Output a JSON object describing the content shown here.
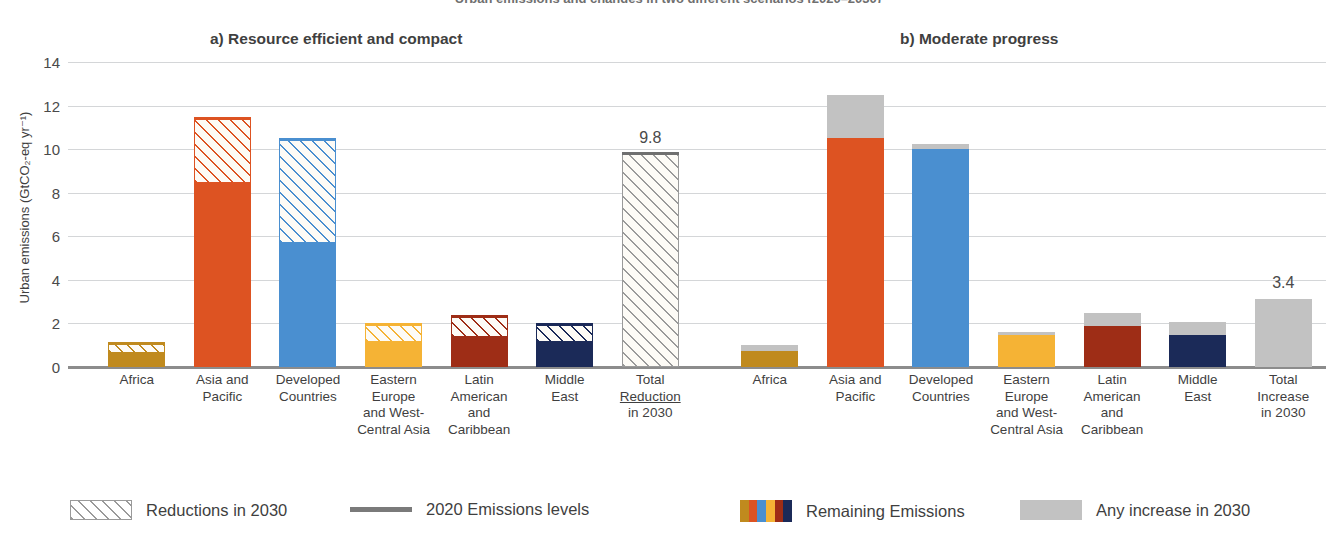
{
  "figure": {
    "suptitle": "Urban emissions and changes in two different scenarios (2020–2030)",
    "y_axis_label": "Urban emissions (GtCO₂-eq yr⁻¹)",
    "y_ticks": [
      "14",
      "12",
      "10",
      "8",
      "6",
      "4",
      "2",
      "0"
    ]
  },
  "panels": {
    "a": {
      "title": "a) Resource efficient and compact"
    },
    "b": {
      "title": "b) Moderate progress"
    }
  },
  "legend": {
    "items": [
      {
        "label": "Reductions in 2030",
        "swatch": "hatched-swatch"
      },
      {
        "label": "2020 Emissions levels",
        "swatch": "line-swatch"
      },
      {
        "label": "Remaining Emissions",
        "swatch": "multicolor-swatch"
      },
      {
        "label": "Any increase in 2030",
        "swatch": "gray-swatch"
      }
    ]
  },
  "colors": {
    "africa": "#c08a1e",
    "asia_pacific": "#dd5322",
    "developed": "#4a8fd0",
    "eastern_europe": "#f5b335",
    "latin_america": "#9e2d16",
    "middle_east": "#1b2a58",
    "total": "#a8a8a8",
    "increase_gray": "#c2c2c2",
    "emissions_level_line": "#6f6f6f",
    "gridline": "#d4d6d8"
  },
  "chart_data": {
    "type": "bar",
    "title": "Urban emissions and changes in two different scenarios (2020–2030)",
    "xlabel": "",
    "ylabel": "Urban emissions (GtCO2-eq yr-1)",
    "ylim": [
      0,
      14
    ],
    "yticks": [
      0,
      2,
      4,
      6,
      8,
      10,
      12,
      14
    ],
    "grid": true,
    "legend_position": "bottom",
    "stacking": "stacked",
    "panels": [
      {
        "key": "a",
        "title": "a) Resource efficient and compact",
        "categories": [
          "Africa",
          "Asia and Pacific",
          "Developed Countries",
          "Eastern Europe and West-Central Asia",
          "Latin American and Caribbean",
          "Middle East",
          "Total Reduction in 2030"
        ],
        "series": [
          {
            "name": "Remaining Emissions",
            "values": [
              0.65,
              8.45,
              5.7,
              1.15,
              1.4,
              1.15,
              0
            ]
          },
          {
            "name": "Reductions in 2030",
            "values": [
              0.4,
              2.95,
              4.7,
              0.8,
              0.9,
              0.8,
              9.8
            ]
          }
        ],
        "emissions_2020_level": [
          1.05,
          11.4,
          10.4,
          1.95,
          2.3,
          1.95,
          9.8
        ],
        "data_labels": {
          "Total Reduction in 2030": "9.8"
        },
        "bar_colors": [
          "#c08a1e",
          "#dd5322",
          "#4a8fd0",
          "#f5b335",
          "#9e2d16",
          "#1b2a58",
          "#a8a8a8"
        ]
      },
      {
        "key": "b",
        "title": "b) Moderate progress",
        "categories": [
          "Africa",
          "Asia and Pacific",
          "Developed Countries",
          "Eastern Europe and West-Central Asia",
          "Latin American and Caribbean",
          "Middle East",
          "Total Increase in 2030"
        ],
        "series": [
          {
            "name": "Remaining Emissions",
            "values": [
              0.75,
              10.5,
              10.0,
              1.45,
              1.9,
              1.45,
              0
            ]
          },
          {
            "name": "Any increase in 2030",
            "values": [
              0.25,
              2.0,
              0.25,
              0.15,
              0.6,
              0.6,
              3.1
            ]
          }
        ],
        "data_labels": {
          "Total Increase in 2030": "3.4"
        },
        "bar_colors": [
          "#c08a1e",
          "#dd5322",
          "#4a8fd0",
          "#f5b335",
          "#9e2d16",
          "#1b2a58",
          "#c2c2c2"
        ]
      }
    ]
  },
  "x_labels": {
    "a": [
      [
        "Africa"
      ],
      [
        "Asia and",
        "Pacific"
      ],
      [
        "Developed",
        "Countries"
      ],
      [
        "Eastern",
        "Europe",
        "and West-",
        "Central Asia"
      ],
      [
        "Latin",
        "American",
        "and",
        "Caribbean"
      ],
      [
        "Middle",
        "East"
      ],
      [
        "Total",
        "Reduction",
        "in 2030"
      ]
    ],
    "b": [
      [
        "Africa"
      ],
      [
        "Asia and",
        "Pacific"
      ],
      [
        "Developed",
        "Countries"
      ],
      [
        "Eastern",
        "Europe",
        "and West-",
        "Central Asia"
      ],
      [
        "Latin",
        "American",
        "and",
        "Caribbean"
      ],
      [
        "Middle",
        "East"
      ],
      [
        "Total",
        "Increase",
        "in 2030"
      ]
    ]
  }
}
